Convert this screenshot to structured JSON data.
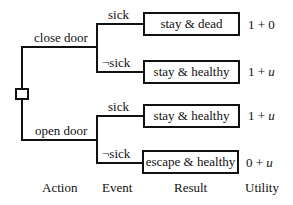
{
  "diagram": {
    "type": "decision-tree",
    "decision_node": "decision",
    "actions": [
      {
        "label": "close door",
        "events": [
          {
            "label": "sick",
            "result": "stay & dead",
            "utility_base": "1",
            "utility_op": "+",
            "utility_term": "0"
          },
          {
            "label": "¬sick",
            "result": "stay & healthy",
            "utility_base": "1",
            "utility_op": "+",
            "utility_term": "u"
          }
        ]
      },
      {
        "label": "open door",
        "events": [
          {
            "label": "sick",
            "result": "stay & healthy",
            "utility_base": "1",
            "utility_op": "+",
            "utility_term": "u"
          },
          {
            "label": "¬sick",
            "result": "escape & healthy",
            "utility_base": "0",
            "utility_op": "+",
            "utility_term": "u"
          }
        ]
      }
    ],
    "column_headers": [
      "Action",
      "Event",
      "Result",
      "Utility"
    ]
  }
}
